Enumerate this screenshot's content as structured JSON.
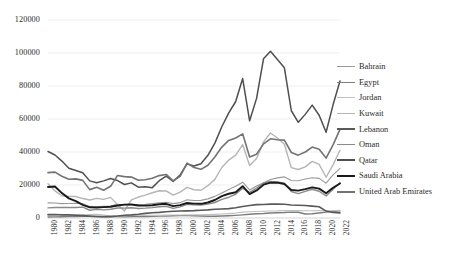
{
  "chart_data": {
    "type": "line",
    "title": "",
    "subtitle": "",
    "xlabel": "",
    "ylabel": "",
    "xlim": [
      1980,
      2022
    ],
    "ylim": [
      0,
      120000
    ],
    "ytick_values": [
      0,
      20000,
      40000,
      60000,
      80000,
      100000,
      120000
    ],
    "ytick_labels": [
      "0",
      "20000",
      "40000",
      "60000",
      "80000",
      "100000",
      "120000"
    ],
    "x": [
      1980,
      1981,
      1982,
      1983,
      1984,
      1985,
      1986,
      1987,
      1988,
      1989,
      1990,
      1991,
      1992,
      1993,
      1994,
      1995,
      1996,
      1997,
      1998,
      1999,
      2000,
      2001,
      2002,
      2003,
      2004,
      2005,
      2006,
      2007,
      2008,
      2009,
      2010,
      2011,
      2012,
      2013,
      2014,
      2015,
      2016,
      2017,
      2018,
      2019,
      2020,
      2021,
      2022
    ],
    "xtick_labels": [
      "1980",
      "1982",
      "1984",
      "1986",
      "1988",
      "1990",
      "1992",
      "1994",
      "1996",
      "1998",
      "2000",
      "2002",
      "2004",
      "2006",
      "2008",
      "2010",
      "2012",
      "2014",
      "2016",
      "2018",
      "2020",
      "2022"
    ],
    "grid": true,
    "grid_axis": "y",
    "legend_position": "right",
    "series": [
      {
        "name": "Bahrain",
        "color": "#9a9a9a",
        "width": 1.1,
        "values": [
          9150,
          9050,
          8700,
          8800,
          8900,
          8600,
          6900,
          6850,
          7050,
          7200,
          8300,
          7900,
          8100,
          8150,
          8250,
          8700,
          9200,
          9500,
          8700,
          9300,
          11000,
          10600,
          10700,
          11600,
          13100,
          15200,
          17300,
          19200,
          21700,
          17000,
          19400,
          21400,
          23300,
          24300,
          24900,
          22700,
          22600,
          23600,
          24400,
          24000,
          21100,
          26100,
          30100
        ]
      },
      {
        "name": "Egypt",
        "color": "#7d7d7d",
        "width": 1.4,
        "values": [
          570,
          700,
          800,
          880,
          930,
          980,
          1010,
          870,
          800,
          950,
          900,
          780,
          810,
          850,
          900,
          1000,
          1120,
          1230,
          1320,
          1440,
          1540,
          1390,
          1250,
          1060,
          1080,
          1190,
          1350,
          1580,
          1900,
          2240,
          2580,
          2730,
          3060,
          3180,
          3300,
          3550,
          3510,
          2440,
          2570,
          3020,
          3540,
          3880,
          4290
        ]
      },
      {
        "name": "Jordan",
        "color": "#c0c0c0",
        "width": 1.1,
        "values": [
          1780,
          1900,
          1960,
          2000,
          1980,
          1940,
          2150,
          2170,
          1790,
          1300,
          1180,
          1250,
          1480,
          1520,
          1570,
          1680,
          1710,
          1740,
          1790,
          1800,
          1820,
          1880,
          1940,
          2030,
          2200,
          2410,
          2680,
          2980,
          3560,
          3800,
          3920,
          4100,
          4230,
          4300,
          4480,
          4580,
          4460,
          4380,
          4410,
          4450,
          4250,
          4500,
          4700
        ]
      },
      {
        "name": "Kuwait",
        "color": "#b5b5b5",
        "width": 1.4,
        "values": [
          20700,
          16400,
          13500,
          13100,
          13000,
          11800,
          10900,
          11900,
          11300,
          12500,
          8100,
          4300,
          11000,
          12700,
          13900,
          15300,
          16500,
          16400,
          13900,
          15700,
          18600,
          17100,
          16800,
          19600,
          23400,
          30600,
          35100,
          38100,
          44500,
          31800,
          36000,
          46100,
          51500,
          48500,
          44700,
          30500,
          29400,
          31000,
          34300,
          32500,
          24700,
          32200,
          41100
        ]
      },
      {
        "name": "Lebanon",
        "color": "#595959",
        "width": 1.6,
        "values": [
          2050,
          2080,
          1900,
          1880,
          1700,
          1450,
          1150,
          900,
          840,
          860,
          1200,
          1660,
          1900,
          2300,
          2800,
          3150,
          3400,
          3800,
          4100,
          4200,
          4300,
          4450,
          4700,
          4950,
          5300,
          5500,
          5700,
          6200,
          7000,
          7600,
          8100,
          8200,
          8400,
          8500,
          8300,
          7900,
          7700,
          7600,
          7200,
          6800,
          4200,
          3300,
          3100
        ]
      },
      {
        "name": "Oman",
        "color": "#8a8a8a",
        "width": 1.4,
        "values": [
          6150,
          6400,
          6400,
          6350,
          6400,
          6600,
          4700,
          5200,
          4900,
          5300,
          6100,
          6000,
          6200,
          5800,
          6000,
          6300,
          6800,
          7100,
          5800,
          6700,
          8300,
          8000,
          7900,
          8400,
          9400,
          11300,
          12600,
          14400,
          18100,
          15500,
          18200,
          21200,
          22200,
          21800,
          21100,
          16000,
          14800,
          16100,
          17400,
          16200,
          13400,
          17400,
          21300
        ]
      },
      {
        "name": "Qatar",
        "color": "#4f4f4f",
        "width": 1.5,
        "values": [
          40300,
          38200,
          34500,
          30200,
          28800,
          27400,
          22500,
          21400,
          22500,
          23900,
          22700,
          20300,
          21300,
          18700,
          19000,
          18400,
          22600,
          25400,
          22200,
          26100,
          32800,
          31500,
          32900,
          38000,
          45400,
          55300,
          63700,
          70600,
          84500,
          58900,
          72500,
          96500,
          101000,
          96000,
          91000,
          65000,
          58000,
          62800,
          68400,
          62300,
          52000,
          68600,
          83000
        ]
      },
      {
        "name": "Saudi Arabia",
        "color": "#1a1a1a",
        "width": 1.9,
        "values": [
          18800,
          19100,
          15100,
          11900,
          10200,
          8000,
          6500,
          6400,
          6600,
          6800,
          7600,
          8100,
          8200,
          7600,
          7500,
          7700,
          8300,
          8600,
          7200,
          7800,
          9100,
          8700,
          8600,
          9400,
          10900,
          13300,
          14700,
          15600,
          19300,
          14500,
          16700,
          20200,
          21400,
          21400,
          20600,
          17000,
          16600,
          17500,
          18600,
          17800,
          15000,
          18300,
          20900
        ]
      },
      {
        "name": "United Arab Emirates",
        "color": "#737373",
        "width": 1.6,
        "values": [
          27500,
          27800,
          25300,
          23500,
          23700,
          22800,
          17200,
          18600,
          16800,
          19200,
          25800,
          25100,
          24800,
          22900,
          23200,
          24100,
          25700,
          26400,
          22500,
          25200,
          33300,
          30600,
          29500,
          32000,
          37000,
          43000,
          47000,
          48500,
          51000,
          37000,
          38600,
          44900,
          48000,
          47400,
          47200,
          39700,
          38100,
          40000,
          43000,
          41700,
          36300,
          44300,
          53700
        ]
      }
    ]
  },
  "legend": {
    "items": [
      {
        "label": "Bahrain"
      },
      {
        "label": "Egypt"
      },
      {
        "label": "Jordan"
      },
      {
        "label": "Kuwait"
      },
      {
        "label": "Lebanon"
      },
      {
        "label": "Oman"
      },
      {
        "label": "Qatar"
      },
      {
        "label": "Saudi Arabia"
      },
      {
        "label": "United Arab Emirates"
      }
    ]
  },
  "colors": {
    "background": "#ffffff",
    "grid": "#e8e8e8",
    "axis": "#d0d0d0",
    "text": "#2b2b2b"
  }
}
